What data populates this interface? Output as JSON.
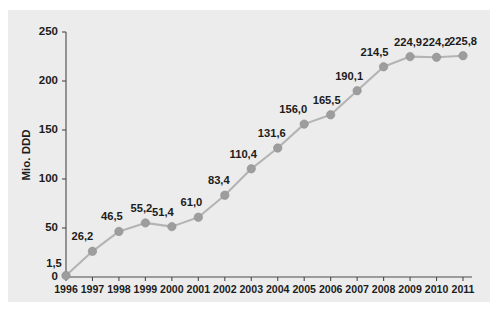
{
  "chart_data": {
    "type": "line",
    "title": "",
    "subtitle": "",
    "xlabel": "",
    "ylabel": "Mio. DDD",
    "categories": [
      "1996",
      "1997",
      "1998",
      "1999",
      "2000",
      "2001",
      "2002",
      "2003",
      "2004",
      "2005",
      "2006",
      "2007",
      "2008",
      "2009",
      "2010",
      "2011"
    ],
    "values": [
      1.5,
      26.2,
      46.5,
      55.2,
      51.4,
      61.0,
      83.4,
      110.4,
      131.6,
      156.0,
      165.5,
      190.1,
      214.5,
      224.9,
      224.2,
      225.8
    ],
    "point_labels": [
      "1,5",
      "26,2",
      "46,5",
      "55,2",
      "51,4",
      "61,0",
      "83,4",
      "110,4",
      "131,6",
      "156,0",
      "165,5",
      "190,1",
      "214,5",
      "224,9",
      "224,2",
      "225,8"
    ],
    "series": [
      {
        "name": "Mio. DDD",
        "values": [
          1.5,
          26.2,
          46.5,
          55.2,
          51.4,
          61.0,
          83.4,
          110.4,
          131.6,
          156.0,
          165.5,
          190.1,
          214.5,
          224.9,
          224.2,
          225.8
        ]
      }
    ],
    "ylim": [
      0,
      250
    ],
    "yticks": [
      0,
      50,
      100,
      150,
      200,
      250
    ],
    "ytick_labels": [
      "0",
      "50",
      "100",
      "150",
      "200",
      "250"
    ],
    "xlim": [
      "1996",
      "2011"
    ],
    "grid": false,
    "legend": false,
    "legend_position": "none",
    "marker": "circle",
    "colors": {
      "panel_background": "#ececec",
      "page_background": "#ffffff",
      "line": "#b4b4b4",
      "marker": "#9d9d9d",
      "axis": "#4a4a4a",
      "text": "#1c1c1c"
    }
  }
}
